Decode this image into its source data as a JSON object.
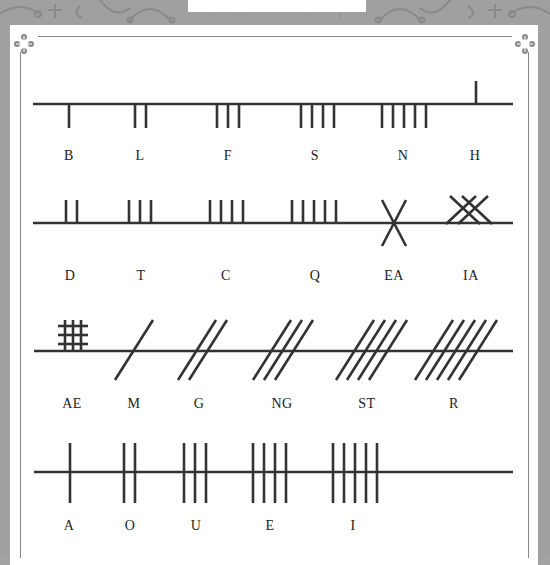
{
  "colors": {
    "frame": "#a0a0a0",
    "panel": "#ffffff",
    "stroke": "#333333",
    "text": "#222222"
  },
  "rows": [
    {
      "name": "aicme-beithe",
      "letters": [
        {
          "label": "B",
          "strokes": 1
        },
        {
          "label": "L",
          "strokes": 2
        },
        {
          "label": "F",
          "strokes": 3
        },
        {
          "label": "S",
          "strokes": 4
        },
        {
          "label": "N",
          "strokes": 5
        },
        {
          "label": "H",
          "strokes": 1
        }
      ]
    },
    {
      "name": "aicme-uatha",
      "letters": [
        {
          "label": "D",
          "strokes": 2
        },
        {
          "label": "T",
          "strokes": 3
        },
        {
          "label": "C",
          "strokes": 4
        },
        {
          "label": "Q",
          "strokes": 5
        },
        {
          "label": "EA",
          "strokes": 2
        },
        {
          "label": "IA",
          "strokes": 4
        }
      ]
    },
    {
      "name": "aicme-muine",
      "letters": [
        {
          "label": "AE",
          "strokes": 6
        },
        {
          "label": "M",
          "strokes": 1
        },
        {
          "label": "G",
          "strokes": 2
        },
        {
          "label": "NG",
          "strokes": 3
        },
        {
          "label": "ST",
          "strokes": 4
        },
        {
          "label": "R",
          "strokes": 5
        }
      ]
    },
    {
      "name": "aicme-ailme",
      "letters": [
        {
          "label": "A",
          "strokes": 1
        },
        {
          "label": "O",
          "strokes": 2
        },
        {
          "label": "U",
          "strokes": 3
        },
        {
          "label": "E",
          "strokes": 4
        },
        {
          "label": "I",
          "strokes": 5
        }
      ]
    }
  ]
}
